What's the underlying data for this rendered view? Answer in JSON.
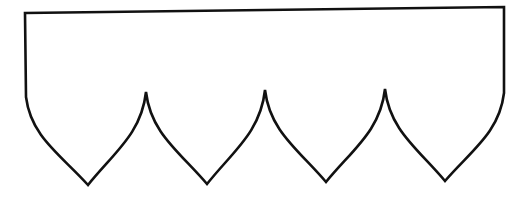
{
  "figure": {
    "background": "#ffffff",
    "stroke_color": "#111111",
    "stroke_width": 2.6,
    "shape": {
      "top_left": [
        25,
        13
      ],
      "top_right": [
        504,
        7
      ],
      "left_side_bottom": [
        26,
        97
      ],
      "right_side_bottom": [
        504,
        93
      ],
      "scallop_points": [
        [
          88,
          185
        ],
        [
          207,
          184
        ],
        [
          326,
          182
        ],
        [
          445,
          181
        ]
      ],
      "cusps": [
        [
          146,
          92
        ],
        [
          265,
          90
        ],
        [
          385,
          89
        ]
      ],
      "scallop_count": 4
    }
  }
}
